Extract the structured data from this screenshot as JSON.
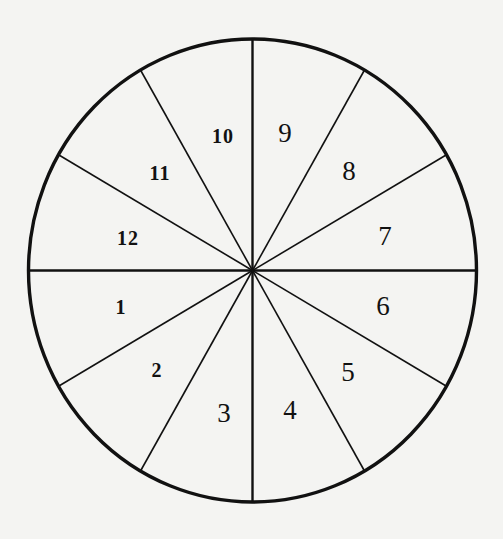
{
  "diagram": {
    "type": "segmented-circle",
    "segment_count": 12,
    "center": [
      252.5,
      270.5
    ],
    "radius_x": 224,
    "radius_y": 231.5,
    "line_color": "#111111",
    "background_color": "#f4f4f2",
    "divider_angles_deg": [
      0,
      30,
      60,
      90,
      120,
      150,
      180,
      210,
      240,
      270,
      300,
      330
    ],
    "segments": [
      {
        "label": "1",
        "x": 121,
        "y": 307
      },
      {
        "label": "2",
        "x": 157,
        "y": 370
      },
      {
        "label": "3",
        "x": 224,
        "y": 413
      },
      {
        "label": "4",
        "x": 290,
        "y": 410
      },
      {
        "label": "5",
        "x": 348,
        "y": 372
      },
      {
        "label": "6",
        "x": 383,
        "y": 306
      },
      {
        "label": "7",
        "x": 385,
        "y": 236
      },
      {
        "label": "8",
        "x": 349,
        "y": 171
      },
      {
        "label": "9",
        "x": 285,
        "y": 133
      },
      {
        "label": "10",
        "x": 223,
        "y": 136
      },
      {
        "label": "11",
        "x": 160,
        "y": 173
      },
      {
        "label": "12",
        "x": 128,
        "y": 238
      }
    ]
  }
}
